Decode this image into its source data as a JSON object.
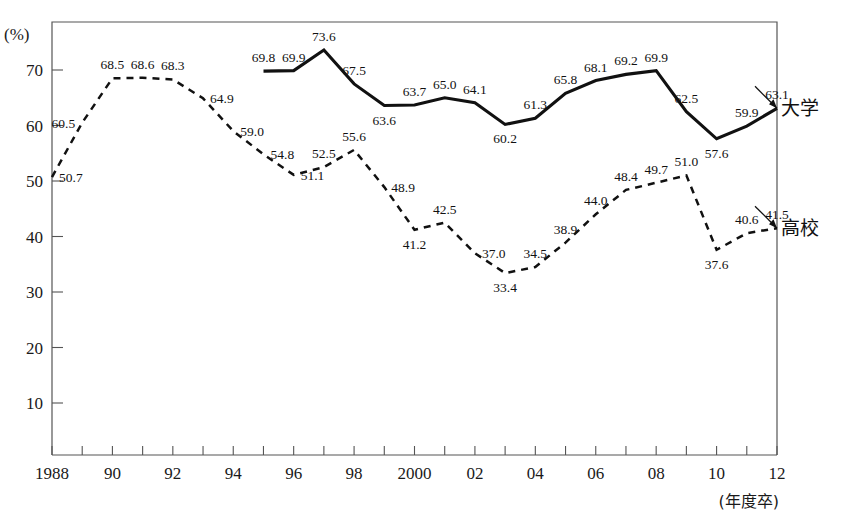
{
  "figure": {
    "cropped_title": "",
    "y_unit_label": "(%)",
    "x_unit_label": "(年度卒)"
  },
  "legend": {
    "university_label": "大学",
    "highschool_label": "高校"
  },
  "chart_data": {
    "type": "line",
    "title": "",
    "xlabel": "(年度卒)",
    "ylabel": "(%)",
    "ylim": [
      0,
      75
    ],
    "xlim": [
      1988,
      2012
    ],
    "grid": false,
    "legend_position": "right-inline",
    "y_ticks": [
      10,
      20,
      30,
      40,
      50,
      60,
      70
    ],
    "x_ticks": [
      1988,
      1989,
      1990,
      1991,
      1992,
      1993,
      1994,
      1995,
      1996,
      1997,
      1998,
      1999,
      2000,
      2001,
      2002,
      2003,
      2004,
      2005,
      2006,
      2007,
      2008,
      2009,
      2010,
      2011,
      2012
    ],
    "x_tick_labels": [
      "1988",
      "",
      "90",
      "",
      "92",
      "",
      "94",
      "",
      "96",
      "",
      "98",
      "",
      "2000",
      "",
      "02",
      "",
      "04",
      "",
      "06",
      "",
      "08",
      "",
      "10",
      "",
      "12"
    ],
    "series": [
      {
        "name": "大学",
        "style": "solid",
        "x": [
          1995,
          1996,
          1997,
          1998,
          1999,
          2000,
          2001,
          2002,
          2003,
          2004,
          2005,
          2006,
          2007,
          2008,
          2009,
          2010,
          2011,
          2012
        ],
        "values": [
          69.8,
          69.9,
          73.6,
          67.5,
          63.6,
          63.7,
          65.0,
          64.1,
          60.2,
          61.3,
          65.8,
          68.1,
          69.2,
          69.9,
          62.5,
          57.6,
          59.9,
          63.1
        ],
        "labels": [
          "69.8",
          "69.9",
          "73.6",
          "67.5",
          "63.6",
          "63.7",
          "65.0",
          "64.1",
          "60.2",
          "61.3",
          "65.8",
          "68.1",
          "69.2",
          "69.9",
          "62.5",
          "57.6",
          "59.9",
          "63.1"
        ],
        "label_positions": [
          "above",
          "above",
          "above",
          "above",
          "below",
          "above",
          "above",
          "above",
          "below",
          "above",
          "above",
          "above",
          "above",
          "above",
          "above",
          "below",
          "above",
          "above"
        ]
      },
      {
        "name": "高校",
        "style": "dashed",
        "x": [
          1988,
          1989,
          1990,
          1991,
          1992,
          1993,
          1994,
          1995,
          1996,
          1997,
          1998,
          1999,
          2000,
          2001,
          2002,
          2003,
          2004,
          2005,
          2006,
          2007,
          2008,
          2009,
          2010,
          2011,
          2012
        ],
        "values": [
          50.7,
          60.5,
          68.5,
          68.6,
          68.3,
          64.9,
          59.0,
          54.8,
          51.1,
          52.5,
          55.6,
          48.9,
          41.2,
          42.5,
          37.0,
          33.4,
          34.5,
          38.9,
          44.0,
          48.4,
          49.7,
          51.0,
          37.6,
          40.6,
          41.5
        ],
        "labels": [
          "50.7",
          "60.5",
          "68.5",
          "68.6",
          "68.3",
          "64.9",
          "59.0",
          "54.8",
          "51.1",
          "52.5",
          "55.6",
          "48.9",
          "41.2",
          "42.5",
          "37.0",
          "33.4",
          "34.5",
          "38.9",
          "44.0",
          "48.4",
          "49.7",
          "51.0",
          "37.6",
          "40.6",
          "41.5"
        ],
        "label_positions": [
          "right",
          "left",
          "above",
          "above",
          "above",
          "right",
          "right",
          "right",
          "right",
          "above",
          "above",
          "right",
          "below",
          "above",
          "right",
          "below",
          "above",
          "above",
          "above",
          "above",
          "above",
          "above",
          "below",
          "above",
          "above"
        ]
      }
    ]
  }
}
